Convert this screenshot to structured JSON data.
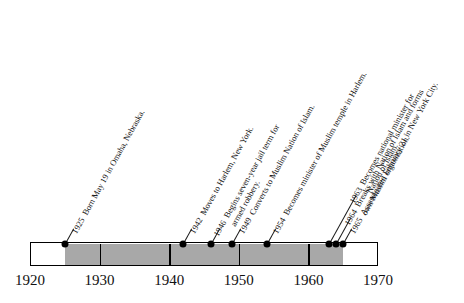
{
  "figure": {
    "type": "timeline",
    "orientation": "horizontal",
    "label_rotation_deg": -61
  },
  "axis": {
    "min_year": 1920,
    "max_year": 1970,
    "ticks": [
      {
        "value": 1920,
        "label": "1920"
      },
      {
        "value": 1930,
        "label": "1930"
      },
      {
        "value": 1940,
        "label": "1940"
      },
      {
        "value": 1950,
        "label": "1950"
      },
      {
        "value": 1960,
        "label": "1960"
      },
      {
        "value": 1970,
        "label": "1970"
      }
    ],
    "dividers": [
      1930,
      1940,
      1950,
      1960
    ]
  },
  "lifespan": {
    "start_year": 1925,
    "end_year": 1965,
    "shade_color": "#a8a8a8"
  },
  "colors": {
    "bar_outline": "#000000",
    "bar_fill": "#ffffff",
    "shade": "#a8a8a8",
    "dot": "#000000",
    "text": "#111111"
  },
  "events": [
    {
      "year": 1925,
      "year_label": "1925",
      "line1": "Born May 19 in Omaha, Nebraska.",
      "line2": ""
    },
    {
      "year": 1942,
      "year_label": "1942",
      "line1": "Moves to Harlem, New York.",
      "line2": ""
    },
    {
      "year": 1946,
      "year_label": "1946",
      "line1": "Begins seven-year jail term for",
      "line2": "armed robbery."
    },
    {
      "year": 1949,
      "year_label": "1949",
      "line1": "Converts to Muslim Nation of Islam.",
      "line2": ""
    },
    {
      "year": 1954,
      "year_label": "1954",
      "line1": "Becomes minister of Muslim temple in Harlem.",
      "line2": ""
    },
    {
      "year": 1963,
      "year_label": "1963",
      "line1": "Becomes national minister for",
      "line2": "Nation of Islam."
    },
    {
      "year": 1964,
      "year_label": "1964",
      "line1": "Breaks with Nation of Islam and forms",
      "line2": "own Muslim organization."
    },
    {
      "year": 1965,
      "year_label": "1965",
      "line1": "Assassinated February 21 in New York City.",
      "line2": ""
    }
  ]
}
